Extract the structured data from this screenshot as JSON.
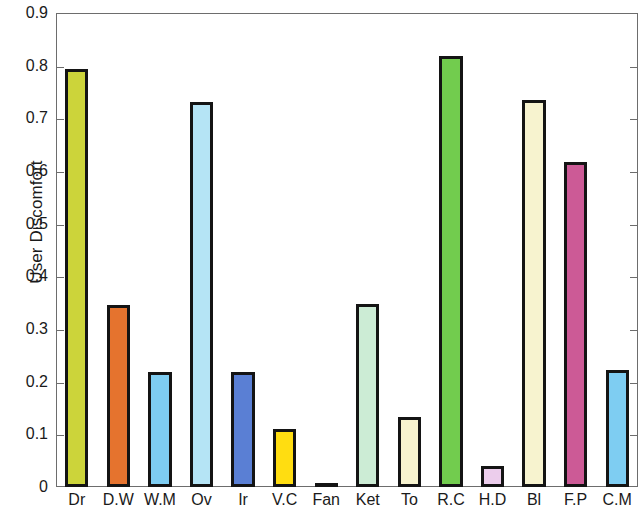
{
  "chart_data": {
    "type": "bar",
    "title": "",
    "subtitle": "",
    "xlabel": "",
    "ylabel": "User Discomfort",
    "categories": [
      "Dr",
      "D.W",
      "W.M",
      "Ov",
      "Ir",
      "V.C",
      "Fan",
      "Ket",
      "To",
      "R.C",
      "H.D",
      "Bl",
      "F.P",
      "C.M"
    ],
    "values": [
      0.793,
      0.345,
      0.218,
      0.731,
      0.218,
      0.11,
      0.005,
      0.348,
      0.132,
      0.818,
      0.04,
      0.735,
      0.618,
      0.222
    ],
    "bar_colors": [
      "#ccd43a",
      "#e5732e",
      "#7ecdf2",
      "#b5e4f5",
      "#5a7fd4",
      "#ffdd11",
      "#3a3a3a",
      "#ccecd5",
      "#f7f3cf",
      "#72cc4e",
      "#eccdec",
      "#f7f3cf",
      "#cc5a96",
      "#7ecdf2"
    ],
    "bar_edge_color": "#141414",
    "ylim": [
      0,
      0.9
    ],
    "xlim": [
      0,
      14
    ],
    "y_ticks": [
      0,
      0.1,
      0.2,
      0.3,
      0.4,
      0.5,
      0.6,
      0.7,
      0.8,
      0.9
    ],
    "y_tick_labels": [
      "0",
      "0.1",
      "0.2",
      "0.3",
      "0.4",
      "0.5",
      "0.6",
      "0.7",
      "0.8",
      "0.9"
    ],
    "grid": false,
    "legend": null,
    "legend_position": "none",
    "background_color": "#ffffff",
    "axis_color": "#6d6d6d",
    "text_color": "#1a1a1a"
  }
}
